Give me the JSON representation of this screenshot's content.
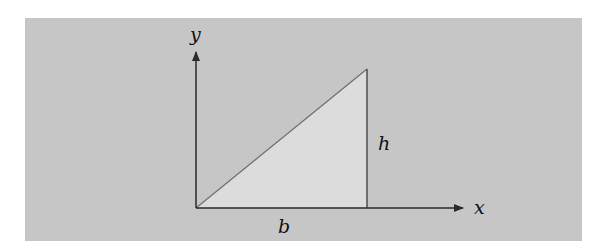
{
  "diagram": {
    "title": "",
    "type": "right triangle on coordinate axes",
    "labels": {
      "y_axis": "y",
      "x_axis": "x",
      "base": "b",
      "height": "h"
    },
    "colors": {
      "background": "#c6c6c6",
      "triangle_fill": "#dcdcdc",
      "axis": "#2a2a2a",
      "hypotenuse": "#6e6e6e"
    }
  }
}
